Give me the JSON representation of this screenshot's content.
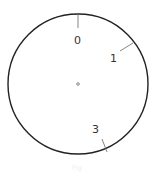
{
  "diagram": {
    "type": "dial",
    "circle": {
      "cx": 78,
      "cy": 84,
      "r": 70,
      "stroke": "#222222"
    },
    "center_dot": {
      "cx": 78,
      "cy": 84,
      "r": 1.3
    },
    "ticks": [
      {
        "label": "0",
        "angle_deg": 0
      },
      {
        "label": "1",
        "angle_deg": 58
      },
      {
        "label": "3",
        "angle_deg": 158
      }
    ],
    "caption": "Fig"
  }
}
